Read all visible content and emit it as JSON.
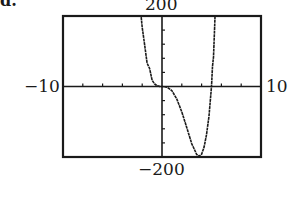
{
  "part_label": "d.",
  "chart_data": {
    "type": "line",
    "title": "",
    "xlabel": "",
    "ylabel": "",
    "xlim": [
      -10,
      10
    ],
    "ylim": [
      -200,
      200
    ],
    "x_tick_step": 2,
    "y_tick_step": 40,
    "grid": false,
    "window_labels": {
      "xmin": "−10",
      "xmax": "10",
      "ymin": "−200",
      "ymax": "200"
    },
    "series": [
      {
        "name": "f(x)",
        "x": [
          -2.1,
          -2.0,
          -1.75,
          -1.5,
          -1.25,
          -1.0,
          -0.75,
          -0.5,
          -0.25,
          0.0,
          0.5,
          1.0,
          1.5,
          2.0,
          2.5,
          3.0,
          3.5,
          3.75,
          4.0,
          4.25,
          4.5,
          4.75,
          5.0,
          5.1,
          5.2,
          5.3,
          5.35
        ],
        "y": [
          197,
          168,
          117,
          66,
          51,
          18,
          7.3,
          2.1,
          0.2,
          0,
          -1.7,
          -12,
          -35.4,
          -72,
          -117,
          -162,
          -192.9,
          -197.8,
          -192,
          -172,
          -136.7,
          -84,
          0,
          57,
          84,
          158,
          198
        ]
      }
    ],
    "frame_color": "#1a1a1a",
    "line_color": "#1a1a1a"
  }
}
